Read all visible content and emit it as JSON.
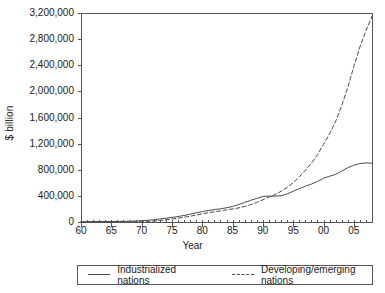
{
  "chart_data": {
    "type": "line",
    "title": "",
    "xlabel": "Year",
    "ylabel": "$ billion",
    "xlim": [
      1960,
      2008
    ],
    "ylim": [
      0,
      3200000
    ],
    "grid": false,
    "legend_position": "bottom",
    "y_ticks": [
      0,
      400000,
      800000,
      1200000,
      1600000,
      2000000,
      2400000,
      2800000,
      3200000
    ],
    "y_tick_labels": [
      "0",
      "400,000",
      "800,000",
      "1,200,000",
      "1,600,000",
      "2,000,000",
      "2,400,000",
      "2,800,000",
      "3,200,000"
    ],
    "x_ticks": [
      1960,
      1965,
      1970,
      1975,
      1980,
      1985,
      1990,
      1995,
      2000,
      2005
    ],
    "x_tick_labels": [
      "60",
      "65",
      "70",
      "75",
      "80",
      "85",
      "90",
      "95",
      "00",
      "05"
    ],
    "x_minor_tick_interval": 1,
    "x": [
      1960,
      1961,
      1962,
      1963,
      1964,
      1965,
      1966,
      1967,
      1968,
      1969,
      1970,
      1971,
      1972,
      1973,
      1974,
      1975,
      1976,
      1977,
      1978,
      1979,
      1980,
      1981,
      1982,
      1983,
      1984,
      1985,
      1986,
      1987,
      1988,
      1989,
      1990,
      1991,
      1992,
      1993,
      1994,
      1995,
      1996,
      1997,
      1998,
      1999,
      2000,
      2001,
      2002,
      2003,
      2004,
      2005,
      2006,
      2007,
      2008
    ],
    "series": [
      {
        "name": "Industrialized nations",
        "style": "solid",
        "color": "#4a4a4a",
        "values": [
          4000,
          4500,
          5000,
          5500,
          6500,
          7500,
          9000,
          10000,
          12000,
          15000,
          20000,
          26000,
          34000,
          46000,
          58000,
          70000,
          84000,
          100000,
          120000,
          140000,
          160000,
          176000,
          190000,
          202000,
          218000,
          238000,
          268000,
          300000,
          332000,
          362000,
          390000,
          398000,
          396000,
          402000,
          430000,
          470000,
          510000,
          548000,
          580000,
          620000,
          670000,
          700000,
          730000,
          780000,
          830000,
          870000,
          895000,
          905000,
          900000
        ]
      },
      {
        "name": "Developing/emerging nations",
        "style": "dashed",
        "color": "#4a4a4a",
        "values": [
          1500,
          1700,
          1900,
          2100,
          2400,
          2800,
          3200,
          3800,
          4500,
          5500,
          7000,
          10000,
          15000,
          23000,
          34000,
          46000,
          58000,
          72000,
          88000,
          106000,
          126000,
          142000,
          156000,
          170000,
          186000,
          200000,
          216000,
          238000,
          266000,
          300000,
          340000,
          380000,
          420000,
          470000,
          530000,
          600000,
          690000,
          790000,
          900000,
          1030000,
          1190000,
          1350000,
          1540000,
          1780000,
          2060000,
          2380000,
          2680000,
          2930000,
          3150000
        ]
      }
    ]
  },
  "legend": {
    "items": [
      {
        "label": "Industrialized nations"
      },
      {
        "label": "Developing/emerging nations"
      }
    ]
  }
}
